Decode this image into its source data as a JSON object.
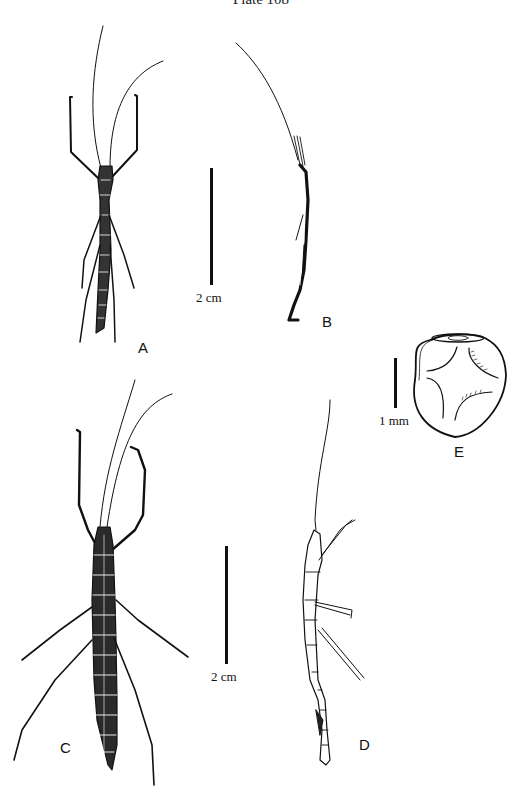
{
  "plate": {
    "title": "Plate 108"
  },
  "figures": [
    {
      "id": "A",
      "label": "A",
      "description": "stick insect dorsal view, small"
    },
    {
      "id": "B",
      "label": "B",
      "description": "stick insect lateral view, small"
    },
    {
      "id": "C",
      "label": "C",
      "description": "stick insect dorsal view, large"
    },
    {
      "id": "D",
      "label": "D",
      "description": "stick insect lateral view, large"
    },
    {
      "id": "E",
      "label": "E",
      "description": "egg"
    }
  ],
  "scale_bars": [
    {
      "for": "A-B",
      "label": "2 cm"
    },
    {
      "for": "C-D",
      "label": "2 cm"
    },
    {
      "for": "E",
      "label": "1 mm"
    }
  ],
  "colors": {
    "ink": "#111111",
    "background": "#ffffff"
  }
}
